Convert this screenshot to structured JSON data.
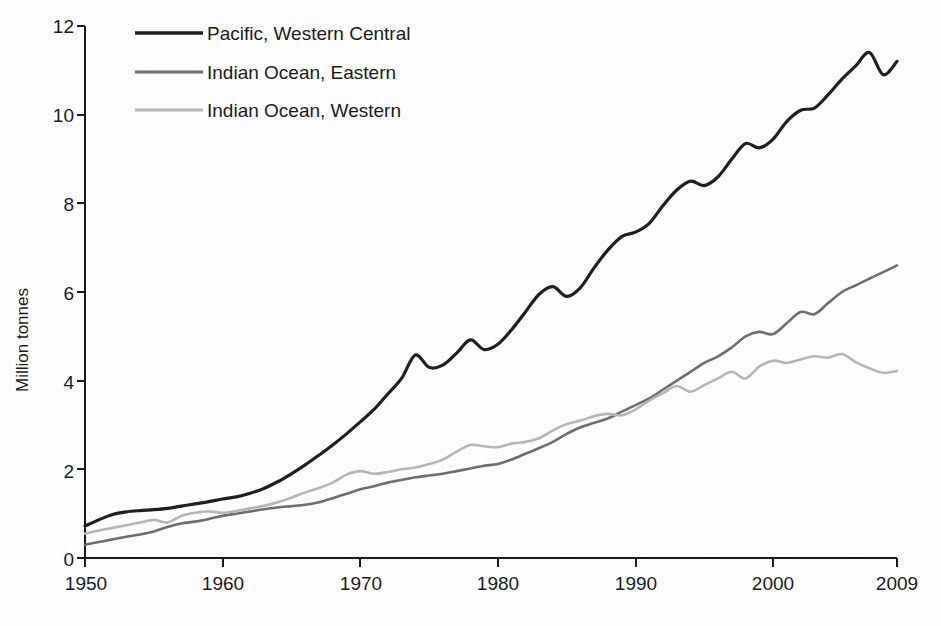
{
  "chart_data": {
    "type": "line",
    "title": "",
    "xlabel": "",
    "ylabel": "Million tonnes",
    "xlim": [
      1950,
      2009
    ],
    "ylim": [
      0,
      12
    ],
    "xticks": [
      1950,
      1960,
      1970,
      1980,
      1990,
      2000,
      2009
    ],
    "yticks": [
      0,
      2,
      4,
      6,
      8,
      10,
      12
    ],
    "grid": false,
    "legend_position": "top-left",
    "x": [
      1950,
      1951,
      1952,
      1953,
      1954,
      1955,
      1956,
      1957,
      1958,
      1959,
      1960,
      1961,
      1962,
      1963,
      1964,
      1965,
      1966,
      1967,
      1968,
      1969,
      1970,
      1971,
      1972,
      1973,
      1974,
      1975,
      1976,
      1977,
      1978,
      1979,
      1980,
      1981,
      1982,
      1983,
      1984,
      1985,
      1986,
      1987,
      1988,
      1989,
      1990,
      1991,
      1992,
      1993,
      1994,
      1995,
      1996,
      1997,
      1998,
      1999,
      2000,
      2001,
      2002,
      2003,
      2004,
      2005,
      2006,
      2007,
      2008,
      2009
    ],
    "series": [
      {
        "name": "Pacific, Western Central",
        "color": "#1f1f1f",
        "width": 3.2,
        "values": [
          0.72,
          0.86,
          0.98,
          1.04,
          1.07,
          1.09,
          1.12,
          1.17,
          1.22,
          1.27,
          1.33,
          1.38,
          1.46,
          1.57,
          1.72,
          1.9,
          2.1,
          2.32,
          2.55,
          2.8,
          3.07,
          3.35,
          3.7,
          4.05,
          4.58,
          4.3,
          4.35,
          4.62,
          4.92,
          4.7,
          4.82,
          5.15,
          5.55,
          5.95,
          6.12,
          5.9,
          6.1,
          6.55,
          6.95,
          7.25,
          7.35,
          7.55,
          7.95,
          8.3,
          8.5,
          8.4,
          8.6,
          9.0,
          9.35,
          9.25,
          9.45,
          9.85,
          10.1,
          10.15,
          10.45,
          10.8,
          11.1,
          11.4,
          10.9,
          11.2
        ]
      },
      {
        "name": "Indian Ocean, Eastern",
        "color": "#6e6e6e",
        "width": 2.6,
        "values": [
          0.3,
          0.36,
          0.42,
          0.48,
          0.53,
          0.6,
          0.7,
          0.78,
          0.82,
          0.88,
          0.95,
          1.0,
          1.05,
          1.1,
          1.14,
          1.17,
          1.2,
          1.26,
          1.35,
          1.45,
          1.55,
          1.62,
          1.7,
          1.76,
          1.82,
          1.86,
          1.9,
          1.96,
          2.02,
          2.08,
          2.12,
          2.22,
          2.35,
          2.48,
          2.62,
          2.8,
          2.95,
          3.05,
          3.15,
          3.3,
          3.45,
          3.6,
          3.8,
          4.0,
          4.2,
          4.4,
          4.55,
          4.75,
          5.0,
          5.1,
          5.05,
          5.3,
          5.55,
          5.5,
          5.75,
          6.0,
          6.15,
          6.3,
          6.45,
          6.6
        ]
      },
      {
        "name": "Indian Ocean, Western",
        "color": "#b5b5b5",
        "width": 2.6,
        "values": [
          0.55,
          0.62,
          0.68,
          0.74,
          0.8,
          0.86,
          0.8,
          0.95,
          1.02,
          1.05,
          1.02,
          1.06,
          1.12,
          1.18,
          1.26,
          1.36,
          1.48,
          1.58,
          1.7,
          1.88,
          1.96,
          1.9,
          1.94,
          2.0,
          2.04,
          2.12,
          2.22,
          2.4,
          2.55,
          2.52,
          2.5,
          2.58,
          2.62,
          2.7,
          2.88,
          3.02,
          3.1,
          3.2,
          3.25,
          3.22,
          3.35,
          3.55,
          3.72,
          3.88,
          3.75,
          3.9,
          4.05,
          4.2,
          4.05,
          4.32,
          4.45,
          4.4,
          4.48,
          4.55,
          4.52,
          4.6,
          4.42,
          4.28,
          4.18,
          4.22
        ]
      }
    ]
  },
  "legend": {
    "items": [
      {
        "label": "Pacific, Western Central"
      },
      {
        "label": "Indian Ocean, Eastern"
      },
      {
        "label": "Indian Ocean, Western"
      }
    ]
  },
  "axes": {
    "y_title": "Million tonnes",
    "y_tick_labels": [
      "12",
      "10",
      "8",
      "6",
      "4",
      "2",
      "0"
    ],
    "x_tick_labels": [
      "1950",
      "1960",
      "1970",
      "1980",
      "1990",
      "2000",
      "2009"
    ]
  }
}
